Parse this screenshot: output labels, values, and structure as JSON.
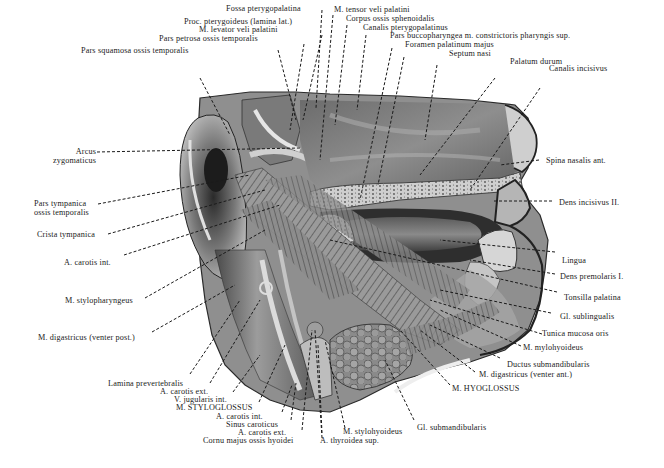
{
  "figure": {
    "colors": {
      "background": "#ffffff",
      "ink": "#222222",
      "tissue_dark": "#3a3a3a",
      "tissue_mid": "#8a8a8a",
      "tissue_light": "#d8d8d8"
    }
  },
  "labels": {
    "top": [
      {
        "id": "fossa-pterygopalatina",
        "text": "Fossa pterygopalatina"
      },
      {
        "id": "m-tensor-veli-palatini",
        "text": "M. tensor veli palatini"
      },
      {
        "id": "corpus-ossis-sphenoidalis",
        "text": "Corpus ossis sphenoidalis"
      },
      {
        "id": "proc-pterygoideus",
        "text": "Proc. pterygoideus (lamina lat.)"
      },
      {
        "id": "canalis-pterygopalatinus",
        "text": "Canalis pterygopalatinus"
      },
      {
        "id": "m-levator-veli-palatini",
        "text": "M. levator veli palatini"
      },
      {
        "id": "pars-buccopharyngea",
        "text": "Pars buccopharyngea m. constrictoris pharyngis sup."
      },
      {
        "id": "pars-petrosa",
        "text": "Pars petrosa ossis temporalis"
      },
      {
        "id": "foramen-palatinum-majus",
        "text": "Foramen palatinum majus"
      },
      {
        "id": "septum-nasi",
        "text": "Septum nasi"
      },
      {
        "id": "pars-squamosa",
        "text": "Pars squamosa ossis temporalis"
      },
      {
        "id": "palatum-durum",
        "text": "Palatum durum"
      },
      {
        "id": "canalis-incisivus",
        "text": "Canalis incisivus"
      }
    ],
    "left": [
      {
        "id": "arcus-zygomaticus",
        "text": "Arcus\nzygomaticus",
        "line1": "Arcus",
        "line2": "zygomaticus"
      },
      {
        "id": "pars-tympanica",
        "text": "Pars tympanica ossis temporalis",
        "line1": "Pars tympanica",
        "line2": "ossis temporalis"
      },
      {
        "id": "crista-tympanica",
        "text": "Crista tympanica"
      },
      {
        "id": "a-carotis-int-left",
        "text": "A. carotis int."
      },
      {
        "id": "m-stylopharyngeus",
        "text": "M. stylopharyngeus"
      },
      {
        "id": "m-digastricus-post",
        "text": "M. digastricus (venter post.)"
      }
    ],
    "right": [
      {
        "id": "spina-nasalis-ant",
        "text": "Spina nasalis ant."
      },
      {
        "id": "dens-incisivus-ii",
        "text": "Dens incisivus II."
      },
      {
        "id": "lingua",
        "text": "Lingua"
      },
      {
        "id": "dens-premolaris-i",
        "text": "Dens premolaris I."
      },
      {
        "id": "tonsilla-palatina",
        "text": "Tonsilla palatina"
      },
      {
        "id": "gl-sublingualis",
        "text": "Gl. sublingualis"
      },
      {
        "id": "tunica-mucosa-oris",
        "text": "Tunica mucosa oris"
      },
      {
        "id": "m-mylohyoideus",
        "text": "M. mylohyoideus"
      },
      {
        "id": "ductus-submandibularis",
        "text": "Ductus submandibularis"
      },
      {
        "id": "m-digastricus-ant",
        "text": "M. digastricus (venter ant.)"
      },
      {
        "id": "m-hyoglossus",
        "text": "M. HYOGLOSSUS"
      }
    ],
    "bottom": [
      {
        "id": "lamina-prevertebralis",
        "text": "Lamina prevertebralis"
      },
      {
        "id": "a-carotis-ext-1",
        "text": "A. carotis ext."
      },
      {
        "id": "v-jugularis-int",
        "text": "V. jugularis int."
      },
      {
        "id": "m-styloglossus",
        "text": "M. STYLOGLOSSUS"
      },
      {
        "id": "a-carotis-int-bottom",
        "text": "A. carotis int."
      },
      {
        "id": "sinus-caroticus",
        "text": "Sinus caroticus"
      },
      {
        "id": "a-carotis-ext-2",
        "text": "A. carotis ext."
      },
      {
        "id": "cornu-majus",
        "text": "Cornu majus ossis hyoidei"
      },
      {
        "id": "m-stylohyoideus",
        "text": "M. stylohyoideus"
      },
      {
        "id": "a-thyroidea-sup",
        "text": "A. thyroidea sup."
      },
      {
        "id": "gl-submandibularis",
        "text": "Gl. submandibularis"
      }
    ]
  }
}
